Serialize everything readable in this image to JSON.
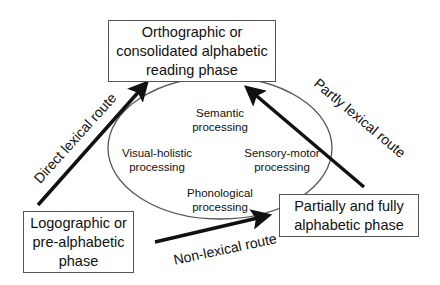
{
  "nodes": {
    "top": {
      "line1": "Orthographic  or",
      "line2": "consolidated alphabetic",
      "line3": "reading phase"
    },
    "bottom_left": {
      "line1": "Logographic or",
      "line2": "pre-alphabetic",
      "line3": "phase"
    },
    "bottom_right": {
      "line1": "Partially and fully",
      "line2": "alphabetic phase"
    }
  },
  "ellipse": {
    "semantic": {
      "line1": "Semantic",
      "line2": "processing"
    },
    "visual": {
      "line1": "Visual-holistic",
      "line2": "processing"
    },
    "sensory": {
      "line1": "Sensory-motor",
      "line2": "processing"
    },
    "phonological": {
      "line1": "Phonological",
      "line2": "processing"
    }
  },
  "routes": {
    "direct": "Direct lexical route",
    "partly": "Partly lexical route",
    "non": "Non-lexical route"
  },
  "colors": {
    "arrow": "#111111",
    "border": "#555555",
    "ellipse": "#555555"
  }
}
